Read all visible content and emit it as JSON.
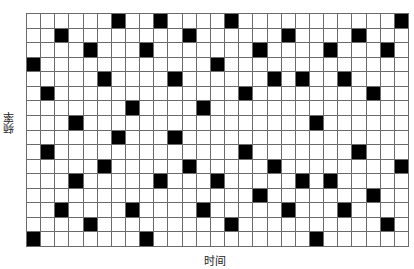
{
  "chart_data": {
    "type": "heatmap",
    "title": "",
    "xlabel": "时间",
    "ylabel": "频率",
    "columns": 27,
    "rows": 16,
    "colors": {
      "on": "#000000",
      "off": "#ffffff",
      "grid": "#6b6b6b"
    },
    "filled_cells_by_row": [
      [
        6,
        9,
        14,
        26
      ],
      [
        2,
        11,
        18,
        23
      ],
      [
        4,
        8,
        16,
        21,
        25
      ],
      [
        0,
        13
      ],
      [
        5,
        10,
        17,
        19,
        22
      ],
      [
        1,
        15,
        24
      ],
      [
        7,
        12
      ],
      [
        3,
        20
      ],
      [
        6,
        10
      ],
      [
        1,
        15,
        23
      ],
      [
        5,
        11,
        17,
        26
      ],
      [
        3,
        9,
        13,
        19,
        21
      ],
      [
        16,
        24
      ],
      [
        2,
        7,
        12,
        18,
        22
      ],
      [
        4,
        14,
        25
      ],
      [
        0,
        8,
        20
      ]
    ]
  },
  "axes": {
    "x_label": "时间",
    "y_label": "频率"
  }
}
